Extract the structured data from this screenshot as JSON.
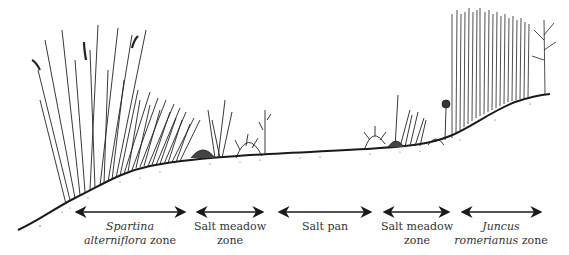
{
  "diagram": {
    "type": "salt marsh cross-section",
    "colors": {
      "ink": "#1a1a1a",
      "text": "#333333",
      "background": "#ffffff"
    },
    "zones": [
      {
        "id": "spartina",
        "line1_italic": "Spartina",
        "line1": "",
        "line2_italic": "alterniflora",
        "line2": " zone",
        "arrow": [
          75,
          186
        ],
        "center": 130
      },
      {
        "id": "salt-meadow-1",
        "line1_italic": "",
        "line1": "Salt meadow",
        "line2_italic": "",
        "line2": "zone",
        "arrow": [
          196,
          264
        ],
        "center": 230
      },
      {
        "id": "salt-pan",
        "line1_italic": "",
        "line1": "Salt pan",
        "line2_italic": "",
        "line2": "",
        "arrow": [
          278,
          372
        ],
        "center": 325
      },
      {
        "id": "salt-meadow-2",
        "line1_italic": "",
        "line1": "Salt meadow",
        "line2_italic": "",
        "line2": "zone",
        "arrow": [
          383,
          450
        ],
        "center": 417
      },
      {
        "id": "juncus",
        "line1_italic": "Juncus",
        "line1": "",
        "line2_italic": "romerianus",
        "line2": " zone",
        "arrow": [
          461,
          542
        ],
        "center": 501
      }
    ]
  }
}
